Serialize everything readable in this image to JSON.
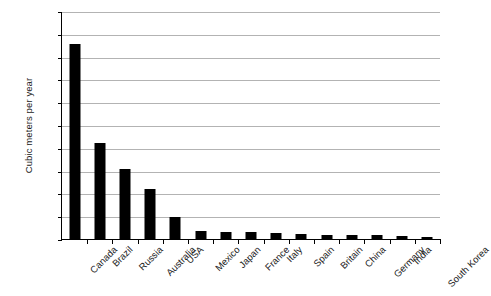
{
  "chart_data": {
    "type": "bar",
    "title": "",
    "subtitle": "",
    "xlabel": "",
    "ylabel": "Cubic meters per year",
    "ylim": [
      0,
      100000
    ],
    "ytick_step": 10000,
    "yticks": [
      "0",
      "10,000",
      "20,000",
      "30,000",
      "40,000",
      "50,000",
      "60,000",
      "70,000",
      "80,000",
      "90,000",
      "100,000"
    ],
    "ytick_values": [
      0,
      10000,
      20000,
      30000,
      40000,
      50000,
      60000,
      70000,
      80000,
      90000,
      100000
    ],
    "grid": true,
    "grid_axis": "y",
    "legend": false,
    "legend_position": "none",
    "bar_color": "#000000",
    "grid_color": "#b3b3b3",
    "axis_color": "#000000",
    "background_color": "#ffffff",
    "categories": [
      "Canada",
      "Brazil",
      "Russia",
      "Australia",
      "USA",
      "Mexico",
      "Japan",
      "France",
      "Italy",
      "Spain",
      "Britain",
      "China",
      "Germany",
      "India",
      "South Korea"
    ],
    "values": [
      86000,
      42500,
      31000,
      22500,
      10000,
      4000,
      3500,
      3300,
      3000,
      2800,
      2400,
      2200,
      2000,
      1700,
      1500
    ],
    "series": [
      {
        "name": "Cubic meters per year",
        "values": [
          86000,
          42500,
          31000,
          22500,
          10000,
          4000,
          3500,
          3300,
          3000,
          2800,
          2400,
          2200,
          2000,
          1700,
          1500
        ]
      }
    ]
  }
}
